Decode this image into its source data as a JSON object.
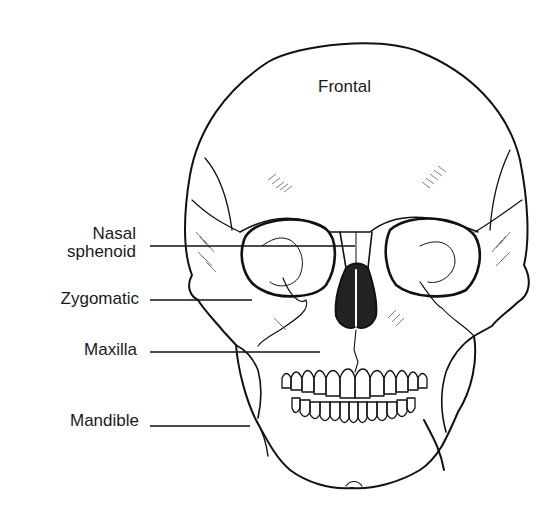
{
  "diagram": {
    "colors": {
      "line": "#111111",
      "background": "#ffffff",
      "text": "#1a1a1a"
    },
    "labels": {
      "frontal": "Frontal",
      "nasal_line1": "Nasal",
      "nasal_line2": "sphenoid",
      "zygomatic": "Zygomatic",
      "maxilla": "Maxilla",
      "mandible": "Mandible"
    }
  }
}
